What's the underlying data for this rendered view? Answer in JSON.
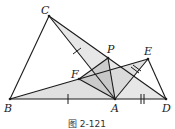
{
  "figure": {
    "caption": "图 2-121",
    "points": {
      "A": {
        "label": "A",
        "x": 115,
        "y": 99
      },
      "B": {
        "label": "B",
        "x": 10,
        "y": 99
      },
      "C": {
        "label": "C",
        "x": 49,
        "y": 16
      },
      "D": {
        "label": "D",
        "x": 166,
        "y": 99
      },
      "E": {
        "label": "E",
        "x": 148,
        "y": 59
      },
      "F": {
        "label": "F",
        "x": 79,
        "y": 79
      },
      "P": {
        "label": "P",
        "x": 108,
        "y": 58
      }
    },
    "segments": [
      "BC",
      "BD",
      "CA",
      "CD",
      "BE",
      "EA",
      "ED",
      "FA",
      "FP",
      "PA",
      "FE"
    ],
    "shaded_triangles": [
      "ACD",
      "ABE",
      "FPA"
    ],
    "tick_marks": {
      "single": [
        "BA",
        "CA"
      ],
      "double": [
        "AD",
        "AE"
      ]
    },
    "colors": {
      "line": "#1a1a1a",
      "shade_light": "#e6e6e6",
      "shade_dark": "#bdbdbd"
    }
  }
}
